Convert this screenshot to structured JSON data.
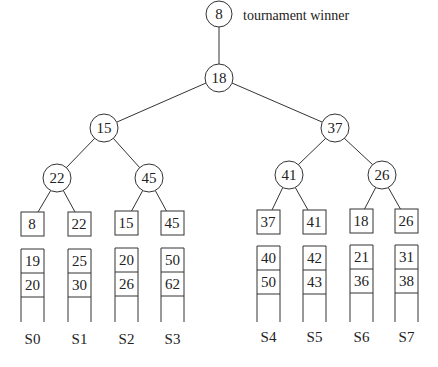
{
  "caption": "tournament winner",
  "winner": "8",
  "tree": {
    "root": "18",
    "level1": [
      "15",
      "37"
    ],
    "level2": [
      "22",
      "45",
      "41",
      "26"
    ],
    "leaves": [
      "8",
      "22",
      "15",
      "45",
      "37",
      "41",
      "18",
      "26"
    ]
  },
  "runs": [
    {
      "label": "S0",
      "values": [
        "19",
        "20"
      ]
    },
    {
      "label": "S1",
      "values": [
        "25",
        "30"
      ]
    },
    {
      "label": "S2",
      "values": [
        "20",
        "26"
      ]
    },
    {
      "label": "S3",
      "values": [
        "50",
        "62"
      ]
    },
    {
      "label": "S4",
      "values": [
        "40",
        "50"
      ]
    },
    {
      "label": "S5",
      "values": [
        "42",
        "43"
      ]
    },
    {
      "label": "S6",
      "values": [
        "21",
        "36"
      ]
    },
    {
      "label": "S7",
      "values": [
        "31",
        "38"
      ]
    }
  ],
  "colors": {
    "stroke": "#333333",
    "text": "#222222",
    "background": "#ffffff"
  }
}
